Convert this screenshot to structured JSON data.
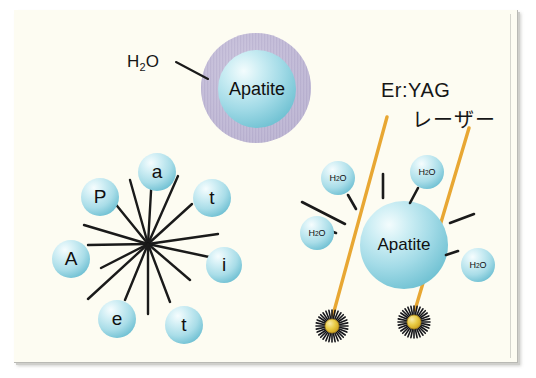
{
  "figure": {
    "title_alt": "Er:YAG laser interaction with apatite and water",
    "background_color": "#fdfcf2",
    "frame_color": "#b9b9b4"
  },
  "colors": {
    "sphere_cyan_light": "#eaf8fa",
    "sphere_cyan_mid": "#a9dce6",
    "sphere_cyan_deep": "#6fc3d4",
    "halo_purple": "#bdb6d4",
    "laser_orange": "#e8a733",
    "burst_yellow": "#e8c53a",
    "line_black": "#1a1a1a",
    "text_black": "#161616"
  },
  "top_group": {
    "name": "apatite-with-water-halo",
    "callout_label": "H",
    "callout_sub": "2",
    "callout_label_end": "O",
    "sphere_label": "Apatite"
  },
  "left_group": {
    "name": "apatite-dissociation-starburst",
    "letters": [
      {
        "id": "a",
        "label": "a"
      },
      {
        "id": "P",
        "label": "P"
      },
      {
        "id": "t1",
        "label": "t"
      },
      {
        "id": "A",
        "label": "A"
      },
      {
        "id": "i",
        "label": "i"
      },
      {
        "id": "e",
        "label": "e"
      },
      {
        "id": "t2",
        "label": "t"
      }
    ],
    "ray_count": 14
  },
  "right_group": {
    "name": "laser-irradiation-scene",
    "beam_label_line1": "Er:YAG",
    "beam_label_line2": "レーザー",
    "sphere_label": "Apatite",
    "water_molecules": [
      {
        "id": "h2o-1",
        "label": "H",
        "sub": "2",
        "label_end": "O"
      },
      {
        "id": "h2o-2",
        "label": "H",
        "sub": "2",
        "label_end": "O"
      },
      {
        "id": "h2o-3",
        "label": "H",
        "sub": "2",
        "label_end": "O"
      },
      {
        "id": "h2o-4",
        "label": "H",
        "sub": "2",
        "label_end": "O"
      }
    ],
    "beams": 2,
    "impact_bursts": 2
  }
}
